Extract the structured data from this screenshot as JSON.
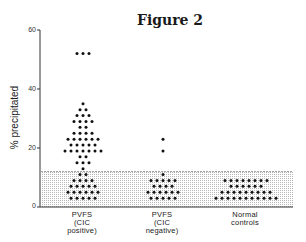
{
  "chart_data": {
    "type": "scatter",
    "subtype": "dot-plot",
    "title": "Figure 2",
    "xlabel": "",
    "ylabel": "% precipitated",
    "ylim": [
      0,
      60
    ],
    "yticks": [
      "0",
      "20",
      "40",
      "60"
    ],
    "grid": false,
    "legend": null,
    "shaded_band": {
      "from": 0,
      "to": 12,
      "description": "normal range (stippled)"
    },
    "categories": [
      {
        "lines": [
          "PVFS",
          "(CIC",
          "positive)"
        ]
      },
      {
        "lines": [
          "PVFS",
          "(CIC",
          "negative)"
        ]
      },
      {
        "lines": [
          "Normal",
          "controls"
        ]
      }
    ],
    "series": [
      {
        "name": "PVFS (CIC positive)",
        "rows": [
          {
            "y": 52,
            "count": 3
          },
          {
            "y": 35,
            "count": 1
          },
          {
            "y": 33,
            "count": 2
          },
          {
            "y": 31,
            "count": 3
          },
          {
            "y": 29,
            "count": 4
          },
          {
            "y": 27,
            "count": 2
          },
          {
            "y": 25,
            "count": 4
          },
          {
            "y": 23,
            "count": 6
          },
          {
            "y": 21,
            "count": 5
          },
          {
            "y": 19,
            "count": 7
          },
          {
            "y": 17,
            "count": 2
          },
          {
            "y": 15,
            "count": 3
          },
          {
            "y": 13,
            "count": 1
          },
          {
            "y": 11,
            "count": 2
          },
          {
            "y": 9,
            "count": 4
          },
          {
            "y": 7,
            "count": 5
          },
          {
            "y": 5,
            "count": 6
          },
          {
            "y": 3,
            "count": 5
          }
        ]
      },
      {
        "name": "PVFS (CIC negative)",
        "rows": [
          {
            "y": 23,
            "count": 1
          },
          {
            "y": 19,
            "count": 1
          },
          {
            "y": 11,
            "count": 1
          },
          {
            "y": 9,
            "count": 5
          },
          {
            "y": 7,
            "count": 4
          },
          {
            "y": 5,
            "count": 6
          },
          {
            "y": 3,
            "count": 5
          }
        ]
      },
      {
        "name": "Normal controls",
        "rows": [
          {
            "y": 9,
            "count": 8
          },
          {
            "y": 7,
            "count": 6
          },
          {
            "y": 5,
            "count": 9
          },
          {
            "y": 3,
            "count": 11
          }
        ]
      }
    ]
  }
}
